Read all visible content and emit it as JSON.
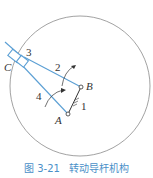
{
  "figure": {
    "caption_number": "图 3-21",
    "caption_title": "转动导杆机构",
    "labels": {
      "point_A": "A",
      "point_B": "B",
      "point_C": "C",
      "link_1": "1",
      "link_2": "2",
      "link_3": "3",
      "link_4": "4"
    },
    "colors": {
      "link": "#5b9fd4",
      "circle": "#888888",
      "text": "#333333",
      "caption": "#4a90c8"
    }
  }
}
